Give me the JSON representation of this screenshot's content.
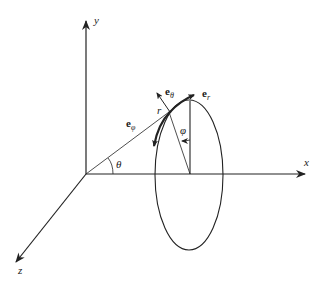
{
  "diagram": {
    "axes": {
      "x": {
        "label": "x"
      },
      "y": {
        "label": "y"
      },
      "z": {
        "label": "z"
      }
    },
    "angles": {
      "theta": "θ",
      "phi": "φ"
    },
    "radius_label": "r",
    "unit_vectors": [
      {
        "name": "e_r",
        "base": "e",
        "sub": "r"
      },
      {
        "name": "e_theta",
        "base": "e",
        "sub": "θ"
      },
      {
        "name": "e_phi",
        "base": "e",
        "sub": "φ"
      }
    ],
    "colors": {
      "stroke": "#222222",
      "background": "#ffffff"
    }
  }
}
